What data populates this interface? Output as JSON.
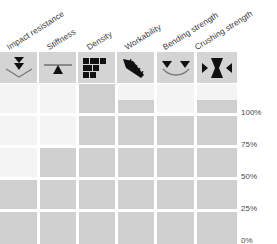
{
  "chart_data": {
    "type": "bar",
    "title": "",
    "xlabel": "",
    "ylabel": "",
    "ylim": [
      0,
      100
    ],
    "grid": true,
    "legend": "none",
    "orientation": "vertical",
    "categories": [
      "Impact resistance",
      "Stiffness",
      "Density",
      "Workability",
      "Bending strength",
      "Crushing strength"
    ],
    "values": [
      40,
      62,
      100,
      90,
      80,
      90
    ],
    "ytick_labels": [
      "100%",
      "75%",
      "50%",
      "25%",
      "0%"
    ],
    "ytick_values": [
      100,
      75,
      50,
      25,
      0
    ],
    "series": [
      {
        "name": "Property rating",
        "values": [
          40,
          62,
          100,
          90,
          80,
          90
        ]
      }
    ],
    "colors": {
      "bar_fill": "#cfcfcf",
      "bar_track": "#f4f4f4",
      "icon_cell_bg": "#d4d4d4",
      "icon_glyph": "#111111",
      "label_text": "#3a3a3a",
      "gridline": "#ffffff"
    }
  },
  "columns": [
    {
      "label": "Impact resistance",
      "icon": "double-down-arrow-impact-icon",
      "value": 40
    },
    {
      "label": "Stiffness",
      "icon": "beam-upward-triangle-icon",
      "value": 62
    },
    {
      "label": "Density",
      "icon": "brick-blocks-icon",
      "value": 100
    },
    {
      "label": "Workability",
      "icon": "diagonal-saw-blade-icon",
      "value": 90
    },
    {
      "label": "Bending strength",
      "icon": "bending-beam-two-arrows-icon",
      "value": 80
    },
    {
      "label": "Crushing strength",
      "icon": "compression-hourglass-icon",
      "value": 90
    }
  ],
  "axis": {
    "ticks": [
      {
        "label": "100%",
        "value": 100
      },
      {
        "label": "75%",
        "value": 75
      },
      {
        "label": "50%",
        "value": 50
      },
      {
        "label": "25%",
        "value": 25
      },
      {
        "label": "0%",
        "value": 0
      }
    ]
  }
}
